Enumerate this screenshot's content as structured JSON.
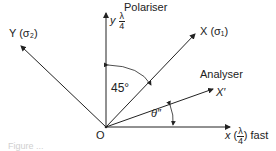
{
  "diagram": {
    "labels": {
      "polariser": "Polariser",
      "analyser": "Analyser",
      "y_axis": "y",
      "y_axis_frac_num": "λ",
      "y_axis_frac_den": "4",
      "Y_axis": "Y (σ₂)",
      "X_axis": "X (σ₁)",
      "X_prime": "X′",
      "x_axis": "x",
      "x_axis_frac_num": "λ",
      "x_axis_frac_den": "4",
      "x_axis_suffix": "fast",
      "angle_45": "45°",
      "angle_theta": "θ″",
      "origin": "O"
    },
    "caption": "Figure ..."
  }
}
